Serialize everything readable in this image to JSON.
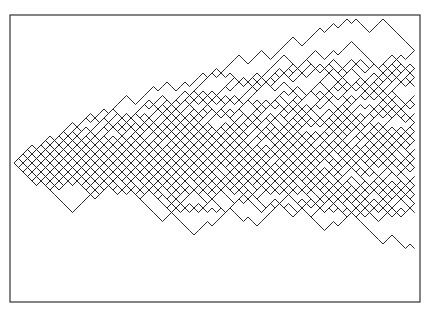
{
  "figure": {
    "type": "random-walk-lattice",
    "frame": {
      "x": 10,
      "y": 15,
      "width": 410,
      "height": 287,
      "stroke": "#333333"
    },
    "origin": {
      "x": 14,
      "y": 163
    },
    "step": 4.5,
    "num_steps": 89,
    "num_paths": 60,
    "seed": 7,
    "line_color": "#2a2a2a",
    "line_width": 1
  }
}
